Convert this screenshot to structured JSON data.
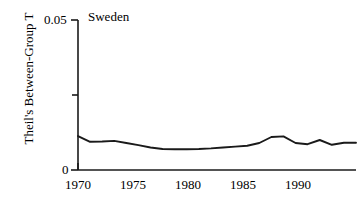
{
  "chart_data": {
    "type": "line",
    "title": "Sweden",
    "xlabel": "",
    "ylabel": "Theil's Between-Group T",
    "xlim": [
      1970,
      1993
    ],
    "ylim": [
      0,
      0.05
    ],
    "grid": false,
    "legend": "none",
    "y_tick_labels": [
      "0.05",
      "0"
    ],
    "y_ticks": [
      0.05,
      0.025,
      0
    ],
    "y_ticks_labeled": [
      0.05,
      0
    ],
    "x_tick_labels": [
      "1970",
      "1975",
      "1980",
      "1985",
      "1990"
    ],
    "x_ticks": [
      1970,
      1975,
      1980,
      1985,
      1990
    ],
    "line_color": "#1a1a1a",
    "x": [
      1970,
      1971,
      1972,
      1973,
      1974,
      1975,
      1976,
      1977,
      1978,
      1979,
      1980,
      1981,
      1982,
      1983,
      1984,
      1985,
      1986,
      1987,
      1988,
      1989,
      1990,
      1991,
      1992,
      1993
    ],
    "series": [
      {
        "name": "Sweden",
        "values": [
          0.0113,
          0.0094,
          0.0095,
          0.0097,
          0.009,
          0.0083,
          0.0075,
          0.007,
          0.0069,
          0.0069,
          0.007,
          0.0072,
          0.0075,
          0.0078,
          0.0081,
          0.009,
          0.011,
          0.0112,
          0.009,
          0.0086,
          0.01,
          0.0084,
          0.0091,
          0.0091
        ]
      }
    ]
  },
  "axes": {
    "y_top_label": "0.05",
    "y_bottom_label": "0",
    "y_axis_title": "Theil's Between-Group T",
    "x_labels": [
      "1970",
      "1975",
      "1980",
      "1985",
      "1990"
    ]
  },
  "title": {
    "text": "Sweden"
  }
}
